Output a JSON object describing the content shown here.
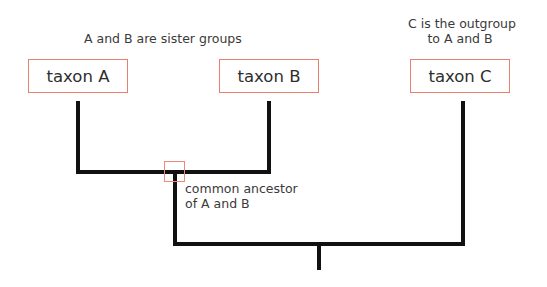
{
  "diagram": {
    "type": "cladogram",
    "captions": {
      "sister_groups": "A and B are sister groups",
      "outgroup_line1": "C is the outgroup",
      "outgroup_line2": "to A and B"
    },
    "taxa": [
      {
        "id": "A",
        "label": "taxon A"
      },
      {
        "id": "B",
        "label": "taxon B"
      },
      {
        "id": "C",
        "label": "taxon C"
      }
    ],
    "nodes": {
      "common_ancestor": {
        "label_line1": "common ancestor",
        "label_line2": "of A and B",
        "children": [
          "A",
          "B"
        ]
      },
      "root": {
        "children": [
          "AB",
          "C"
        ]
      }
    },
    "colors": {
      "box_border": "#e8806f",
      "branch": "#111111",
      "text": "#333333"
    }
  }
}
